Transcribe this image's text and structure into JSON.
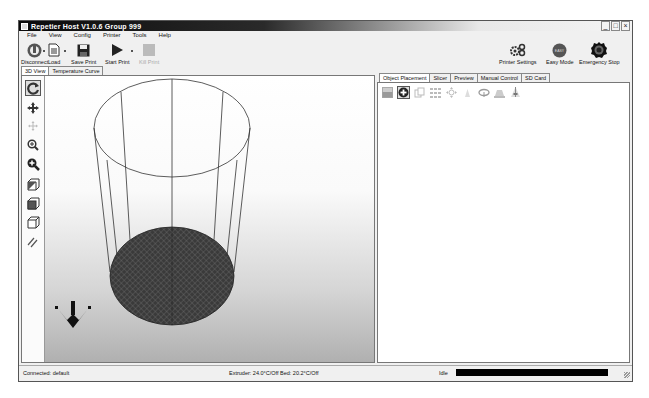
{
  "window": {
    "title": "Repetier Host V1.0.6   Group 999",
    "controls": [
      "_",
      "□",
      "×"
    ]
  },
  "menu": [
    "File",
    "View",
    "Config",
    "Printer",
    "Tools",
    "Help"
  ],
  "toolbar": {
    "left": [
      {
        "id": "disconnect",
        "label": "Disconnect",
        "icon": "power-plug-icon",
        "enabled": true
      },
      {
        "id": "load",
        "label": "Load",
        "icon": "document-icon",
        "enabled": true
      },
      {
        "id": "save_print",
        "label": "Save Print",
        "icon": "floppy-disk-icon",
        "enabled": true
      },
      {
        "id": "start_print",
        "label": "Start Print",
        "icon": "play-icon",
        "enabled": true
      },
      {
        "id": "kill_print",
        "label": "Kill Print",
        "icon": "stop-icon",
        "enabled": false
      }
    ],
    "right": [
      {
        "id": "printer_settings",
        "label": "Printer Settings",
        "icon": "gears-icon"
      },
      {
        "id": "easy_mode",
        "label": "Easy Mode",
        "icon": "easy-mode-icon",
        "badge": "EASY"
      },
      {
        "id": "emergency_stop",
        "label": "Emergency Stop",
        "icon": "emergency-stop-icon"
      }
    ]
  },
  "left_tabs": [
    {
      "label": "3D View",
      "active": true
    },
    {
      "label": "Temperature Curve",
      "active": false
    }
  ],
  "view_tools": [
    {
      "name": "rotate-icon",
      "active": true
    },
    {
      "name": "move-icon",
      "active": false
    },
    {
      "name": "move-object-icon",
      "active": false,
      "disabled": true
    },
    {
      "name": "zoom-icon",
      "active": false
    },
    {
      "name": "zoom-fit-icon",
      "active": false
    },
    {
      "name": "iso-view-icon",
      "active": false
    },
    {
      "name": "front-view-icon",
      "active": false
    },
    {
      "name": "top-view-icon",
      "active": false
    },
    {
      "name": "parallel-view-icon",
      "active": false
    }
  ],
  "right_tabs": [
    {
      "label": "Object Placement",
      "active": true
    },
    {
      "label": "Slicer",
      "active": false
    },
    {
      "label": "Preview",
      "active": false
    },
    {
      "label": "Manual Control",
      "active": false
    },
    {
      "label": "SD Card",
      "active": false
    }
  ],
  "object_tools": [
    {
      "name": "save-stl-icon",
      "active": false
    },
    {
      "name": "add-object-icon",
      "active": true
    },
    {
      "name": "copy-object-icon",
      "active": false
    },
    {
      "name": "autoposition-icon",
      "active": false
    },
    {
      "name": "center-object-icon",
      "active": false
    },
    {
      "name": "scale-object-icon",
      "active": false
    },
    {
      "name": "rotate-object-icon",
      "active": false
    },
    {
      "name": "drop-object-icon",
      "active": false
    },
    {
      "name": "cut-object-icon",
      "active": false
    }
  ],
  "status": {
    "connection": "Connected: default",
    "temps": "Extruder: 24.0°C/Off Bed: 20.2°C/Off",
    "state": "Idle"
  },
  "colors": {
    "bed": "#3a3a3a",
    "frame_lines": "#333333",
    "progress": "#000000"
  }
}
